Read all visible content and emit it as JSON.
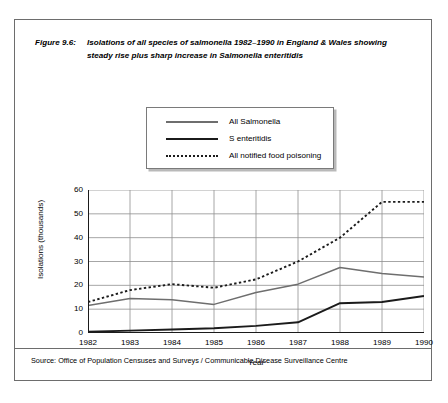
{
  "figure": {
    "label": "Figure 9.6:",
    "title": "Isolations of all species of salmonella 1982–1990 in England & Wales showing  steady rise plus sharp increase in Salmonella enteritidis",
    "source": "Source: Office of Population Censuses and Surveys / Communicable Disease Surveillance Centre"
  },
  "chart_data": {
    "type": "line",
    "title": "Isolations of all species of salmonella 1982–1990 in England & Wales showing  steady rise plus sharp increase in Salmonella enteritidis",
    "xlabel": "Year",
    "ylabel": "Isolations (thousands)",
    "x": [
      1982,
      1983,
      1984,
      1985,
      1986,
      1987,
      1988,
      1989,
      1990
    ],
    "categories": [
      "1982",
      "1983",
      "1984",
      "1985",
      "1986",
      "1987",
      "1988",
      "1989",
      "1990"
    ],
    "xlim": [
      1982,
      1990
    ],
    "ylim": [
      0,
      60
    ],
    "yticks": [
      0,
      10,
      20,
      30,
      40,
      50,
      60
    ],
    "grid": true,
    "legend_position": "above-plot",
    "series": [
      {
        "name": "All Salmonella",
        "color": "#6e6e6e",
        "style": "solid",
        "values": [
          11.5,
          14.5,
          14.0,
          12.0,
          17.0,
          20.5,
          27.5,
          25.0,
          23.5
        ]
      },
      {
        "name": "S enteritidis",
        "color": "#1b1b1b",
        "style": "solid",
        "values": [
          0.5,
          1.0,
          1.5,
          2.0,
          3.0,
          4.5,
          12.5,
          13.0,
          15.5
        ]
      },
      {
        "name": "All notified food poisoning",
        "color": "#1b1b1b",
        "style": "dotted",
        "values": [
          13.0,
          18.0,
          20.5,
          19.0,
          22.5,
          30.0,
          40.0,
          55.0,
          55.0
        ]
      }
    ]
  },
  "axes": {
    "y_ticks": [
      "60",
      "50",
      "40",
      "30",
      "20",
      "10",
      "0"
    ],
    "x_ticks": [
      "1982",
      "1983",
      "1984",
      "1985",
      "1986",
      "1987",
      "1988",
      "1989",
      "1990"
    ],
    "x_title": "Year",
    "y_title": "Isolations (thousands)"
  },
  "legend": {
    "items": [
      {
        "label": "All Salmonella",
        "swatch": "solid-gray-line-icon"
      },
      {
        "label": "S enteritidis",
        "swatch": "solid-black-line-icon"
      },
      {
        "label": "All notified food poisoning",
        "swatch": "dotted-line-icon"
      }
    ]
  }
}
